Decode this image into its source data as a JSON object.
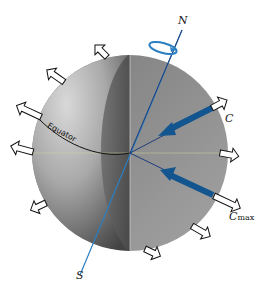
{
  "diagram": {
    "type": "rotating sphere (Earth) with centrifugal force arrows",
    "labels": {
      "north": "N",
      "south": "S",
      "equator": "Equator",
      "c": "C",
      "cmax_main": "C",
      "cmax_sub": "max"
    },
    "colors": {
      "axis_blue": "#2b7fc1",
      "vector_blue": "#13558f",
      "sphere_light": "#c8c8c8",
      "sphere_dark": "#5a5a5a",
      "outline": "#111111"
    },
    "icons": {
      "rotation": "rotation-ellipse-icon",
      "outward_arrow": "hollow-arrow-icon"
    }
  }
}
